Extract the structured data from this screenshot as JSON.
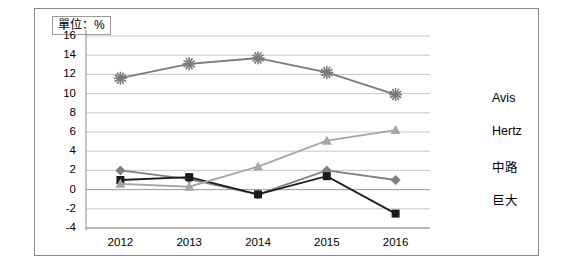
{
  "unit_label": "單位：%",
  "chart_data": {
    "type": "line",
    "title": "",
    "xlabel": "",
    "ylabel": "",
    "unit": "%",
    "categories": [
      "2012",
      "2013",
      "2014",
      "2015",
      "2016"
    ],
    "ylim": [
      -4,
      16
    ],
    "yticks": [
      -4,
      -2,
      0,
      2,
      4,
      6,
      8,
      10,
      12,
      14,
      16
    ],
    "ytick_labels": [
      "-4",
      "-2",
      "0",
      "2",
      "4",
      "6",
      "8",
      "10",
      "12",
      "14",
      "16"
    ],
    "grid": true,
    "legend_position": "right",
    "series": [
      {
        "name": "Avis",
        "marker": "diamond",
        "color": "#808080",
        "values": [
          2.0,
          1.1,
          -0.5,
          2.0,
          1.0
        ]
      },
      {
        "name": "Hertz",
        "marker": "square",
        "color": "#1a1a1a",
        "values": [
          1.0,
          1.3,
          -0.5,
          1.4,
          -2.5
        ]
      },
      {
        "name": "中路",
        "marker": "triangle",
        "color": "#a6a6a6",
        "values": [
          0.6,
          0.3,
          2.4,
          5.1,
          6.2
        ]
      },
      {
        "name": "巨大",
        "marker": "star",
        "color": "#7a7a7a",
        "values": [
          11.6,
          13.1,
          13.7,
          12.2,
          9.9
        ]
      }
    ]
  }
}
